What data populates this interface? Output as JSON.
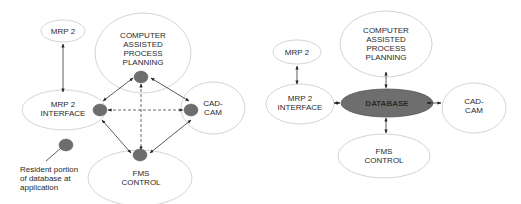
{
  "left_diagram": {
    "title": "Distributed database",
    "nodes": {
      "mrp2": {
        "label": [
          "MRP 2"
        ]
      },
      "capp": {
        "label": [
          "COMPUTER",
          "ASSISTED",
          "PROCESS",
          "PLANNING"
        ]
      },
      "mrp2_interface": {
        "label": [
          "MRP 2",
          "INTERFACE"
        ]
      },
      "cad_cam": {
        "label": [
          "CAD-",
          "CAM"
        ]
      },
      "fms_control": {
        "label": [
          "FMS",
          "CONTROL"
        ]
      }
    },
    "legend": {
      "icon": "resident-database-dot",
      "label": [
        "Resident portion",
        "of database at",
        "application"
      ]
    },
    "connections": [
      {
        "from": "mrp2",
        "to": "mrp2_interface",
        "style": "solid",
        "arrows": "both"
      },
      {
        "from": "capp",
        "to": "mrp2_interface",
        "style": "solid",
        "arrows": "both"
      },
      {
        "from": "capp",
        "to": "cad_cam",
        "style": "solid",
        "arrows": "both"
      },
      {
        "from": "fms_control",
        "to": "mrp2_interface",
        "style": "solid",
        "arrows": "both"
      },
      {
        "from": "fms_control",
        "to": "cad_cam",
        "style": "solid",
        "arrows": "both"
      },
      {
        "from": "capp",
        "to": "fms_control",
        "style": "dashed",
        "arrows": "both"
      },
      {
        "from": "mrp2_interface",
        "to": "cad_cam",
        "style": "dashed",
        "arrows": "both"
      }
    ]
  },
  "right_diagram": {
    "title": "Centralized database",
    "nodes": {
      "mrp2": {
        "label": [
          "MRP 2"
        ]
      },
      "capp": {
        "label": [
          "COMPUTER",
          "ASSISTED",
          "PROCESS",
          "PLANNING"
        ]
      },
      "mrp2_interface": {
        "label": [
          "MRP 2",
          "INTERFACE"
        ]
      },
      "database": {
        "label": [
          "DATABASE"
        ]
      },
      "cad_cam": {
        "label": [
          "CAD-",
          "CAM"
        ]
      },
      "fms_control": {
        "label": [
          "FMS",
          "CONTROL"
        ]
      }
    },
    "connections": [
      {
        "from": "mrp2",
        "to": "mrp2_interface",
        "style": "solid",
        "arrows": "both"
      },
      {
        "from": "capp",
        "to": "database",
        "style": "solid",
        "arrows": "both"
      },
      {
        "from": "mrp2_interface",
        "to": "database",
        "style": "solid",
        "arrows": "both"
      },
      {
        "from": "cad_cam",
        "to": "database",
        "style": "solid",
        "arrows": "both"
      },
      {
        "from": "fms_control",
        "to": "database",
        "style": "solid",
        "arrows": "both"
      }
    ]
  },
  "colors": {
    "ellipse_stroke": "#d4d4d4",
    "database_fill": "#6e6e6e",
    "dot_fill": "#6d6d6d",
    "line": "#333333",
    "text": "#2a2a2a"
  }
}
